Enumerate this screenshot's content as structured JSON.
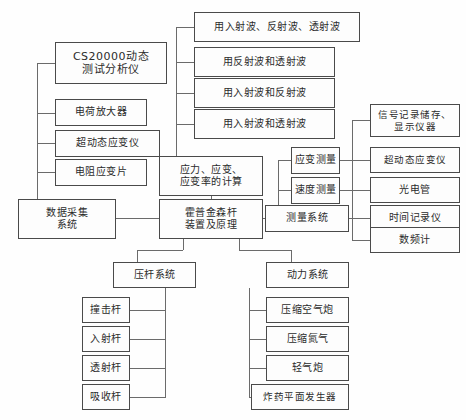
{
  "diagram": {
    "type": "tree-diagram",
    "nodes": {
      "cs20000": "CS20000动态\n测试分析仪",
      "charge_amp": "电荷放大器",
      "ultra_dynamic_strain": "超动态应变仪",
      "resistance_strain_gauge": "电阻应变片",
      "data_acquisition": "数据采集\n系统",
      "wave_all_three": "用入射波、反射波、透射波",
      "wave_ref_trans": "用反射波和透射波",
      "wave_inc_ref": "用入射波和反射波",
      "wave_inc_trans": "用入射波和透射波",
      "calculation": "应力、应变、\n应变率的计算",
      "hopkinson": "霍普金森杆\n装置及原理",
      "strain_measure": "应变测量",
      "velocity_measure": "速度测量",
      "measure_system": "测量系统",
      "signal_record": "信号记录储存、\n显示仪器",
      "ultra_dynamic_strain2": "超动态应变仪",
      "photo_tube": "光电管",
      "time_recorder": "时间记录仪",
      "freq_counter": "数频计",
      "bar_system": "压杆系统",
      "striker_bar": "撞击杆",
      "incident_bar": "入射杆",
      "transmission_bar": "透射杆",
      "absorption_bar": "吸收杆",
      "power_system": "动力系统",
      "compressed_air_gun": "压缩空气炮",
      "compressed_nitrogen": "压缩氮气",
      "light_gas_gun": "轻气炮",
      "explosive_plane_generator": "炸药平面发生器"
    },
    "colors": {
      "border": "#4a4a4a",
      "text": "#2b2b2b",
      "line": "#6b6b6b",
      "background": "#fefefe"
    }
  }
}
